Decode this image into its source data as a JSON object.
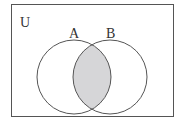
{
  "diagram": {
    "type": "venn",
    "universe_label": "U",
    "sets": [
      {
        "label": "A",
        "cx": 74,
        "cy": 77,
        "r": 37
      },
      {
        "label": "B",
        "cx": 110,
        "cy": 77,
        "r": 37
      }
    ],
    "shaded_region": "A ∩ B",
    "colors": {
      "stroke": "#555555",
      "shade": "#d6d6d8",
      "background": "#ffffff"
    }
  }
}
